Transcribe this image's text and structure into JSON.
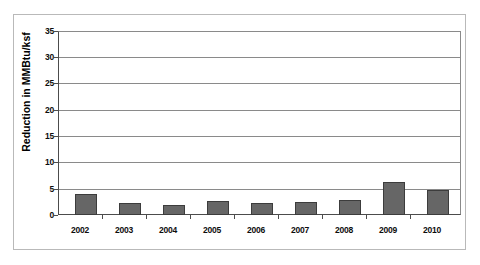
{
  "chart_data": {
    "type": "bar",
    "title": "",
    "xlabel": "",
    "ylabel": "Reduction in MMBtu/ksf",
    "categories": [
      "2002",
      "2003",
      "2004",
      "2005",
      "2006",
      "2007",
      "2008",
      "2009",
      "2010"
    ],
    "values": [
      4.0,
      2.2,
      2.0,
      2.6,
      2.2,
      2.4,
      2.8,
      6.3,
      4.8
    ],
    "ylim": [
      0,
      35
    ],
    "ytick_labels": [
      "35",
      "30",
      "25",
      "20",
      "15",
      "10",
      "5",
      "0"
    ],
    "ytick_values": [
      35,
      30,
      25,
      20,
      15,
      10,
      5,
      0
    ],
    "grid": true,
    "legend": "none",
    "series": [
      {
        "name": "Reduction",
        "values": [
          4.0,
          2.2,
          2.0,
          2.6,
          2.2,
          2.4,
          2.8,
          6.3,
          4.8
        ]
      }
    ],
    "colors": {
      "bar_fill": "#666666",
      "bar_border": "#3c3c3c",
      "gridline": "#8a8a8a",
      "axis": "#4c4c4c",
      "frame": "#b9b9b9",
      "plot_background": "#ffffff",
      "text": "#000000"
    }
  }
}
